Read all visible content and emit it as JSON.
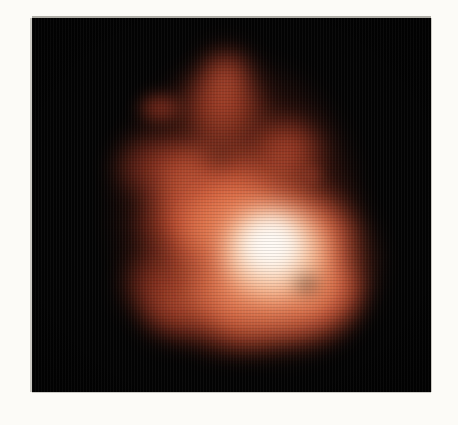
{
  "figure": {
    "panel": {
      "background_color": "#030303",
      "left": 32,
      "top": 18,
      "width": 399,
      "height": 374
    },
    "paper_background_color": "#fcfbf7",
    "colormap": {
      "name": "heat",
      "low_color": "#000000",
      "mid_color": "#a03520",
      "high_color": "#f6e4da"
    }
  },
  "chart_data": {
    "type": "heatmap",
    "title": "",
    "subtitle": "",
    "xlabel": "",
    "ylabel": "",
    "grid": false,
    "legend": "none",
    "axis_ticks": [],
    "tick_labels": [],
    "colorbar": false,
    "colormap": "black-red-white (heat)",
    "xlim": [
      0,
      399
    ],
    "ylim": [
      0,
      374
    ],
    "features": [
      {
        "name": "bright-core",
        "cx": 240,
        "cy": 230,
        "rx": 52,
        "ry": 48,
        "peak_color": "#f8e4d8",
        "relative_intensity": 1.0
      },
      {
        "name": "core-halo",
        "cx": 245,
        "cy": 245,
        "rx": 95,
        "ry": 88,
        "peak_color": "#c87a52",
        "relative_intensity": 0.62
      },
      {
        "name": "north-lobe",
        "cx": 222,
        "cy": 104,
        "rx": 42,
        "ry": 40,
        "peak_color": "#9c3420",
        "relative_intensity": 0.34
      },
      {
        "name": "north-east-spur",
        "cx": 283,
        "cy": 150,
        "rx": 34,
        "ry": 30,
        "peak_color": "#96301e",
        "relative_intensity": 0.31
      },
      {
        "name": "west-arm",
        "cx": 152,
        "cy": 162,
        "rx": 40,
        "ry": 30,
        "peak_color": "#8e2c1c",
        "relative_intensity": 0.29
      },
      {
        "name": "south-west-foot",
        "cx": 156,
        "cy": 282,
        "rx": 33,
        "ry": 30,
        "peak_color": "#8a2a1a",
        "relative_intensity": 0.28
      },
      {
        "name": "south-lobe",
        "cx": 232,
        "cy": 305,
        "rx": 44,
        "ry": 33,
        "peak_color": "#93301e",
        "relative_intensity": 0.3
      },
      {
        "name": "south-east-lobe",
        "cx": 300,
        "cy": 292,
        "rx": 42,
        "ry": 38,
        "peak_color": "#9b3520",
        "relative_intensity": 0.33
      },
      {
        "name": "east-knob",
        "cx": 316,
        "cy": 233,
        "rx": 26,
        "ry": 24,
        "peak_color": "#96301e",
        "relative_intensity": 0.3
      },
      {
        "name": "detached-knot-northwest",
        "cx": 157,
        "cy": 106,
        "rx": 20,
        "ry": 14,
        "peak_color": "#7e2416",
        "relative_intensity": 0.24
      },
      {
        "name": "faint-spot-east",
        "cx": 313,
        "cy": 177,
        "rx": 9,
        "ry": 9,
        "peak_color": "#5e1a10",
        "relative_intensity": 0.15
      },
      {
        "name": "mid-bridge",
        "cx": 200,
        "cy": 185,
        "rx": 48,
        "ry": 44,
        "peak_color": "#a5381f",
        "relative_intensity": 0.38
      }
    ]
  }
}
